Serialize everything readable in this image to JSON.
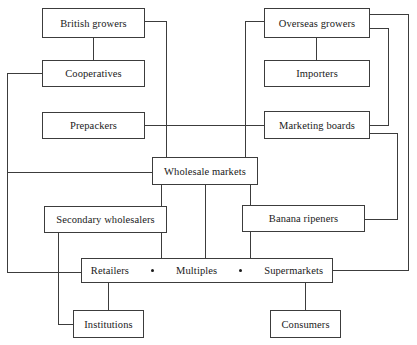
{
  "diagram": {
    "line_color": "#3c3c3c",
    "box_fill": "#ffffff",
    "nodes": [
      {
        "id": "british-growers",
        "label": "British growers",
        "x": 42,
        "y": 8,
        "w": 103,
        "h": 30
      },
      {
        "id": "overseas-growers",
        "label": "Overseas growers",
        "x": 264,
        "y": 8,
        "w": 106,
        "h": 30
      },
      {
        "id": "cooperatives",
        "label": "Cooperatives",
        "x": 42,
        "y": 60,
        "w": 103,
        "h": 27
      },
      {
        "id": "importers",
        "label": "Importers",
        "x": 264,
        "y": 60,
        "w": 106,
        "h": 27
      },
      {
        "id": "prepackers",
        "label": "Prepackers",
        "x": 42,
        "y": 112,
        "w": 103,
        "h": 27
      },
      {
        "id": "marketing-boards",
        "label": "Marketing boards",
        "x": 264,
        "y": 111,
        "w": 106,
        "h": 28
      },
      {
        "id": "wholesale-markets",
        "label": "Wholesale markets",
        "x": 152,
        "y": 157,
        "w": 106,
        "h": 28
      },
      {
        "id": "secondary-wholesalers",
        "label": "Secondary wholesalers",
        "x": 44,
        "y": 206,
        "w": 123,
        "h": 27
      },
      {
        "id": "banana-ripeners",
        "label": "Banana ripeners",
        "x": 242,
        "y": 205,
        "w": 123,
        "h": 27
      },
      {
        "id": "institutions",
        "label": "Institutions",
        "x": 73,
        "y": 310,
        "w": 71,
        "h": 28
      },
      {
        "id": "consumers",
        "label": "Consumers",
        "x": 270,
        "y": 310,
        "w": 71,
        "h": 28
      }
    ],
    "retail_row": {
      "id": "retailers-row",
      "x": 81,
      "y": 258,
      "w": 252,
      "h": 25,
      "labels": [
        "Retailers",
        "Multiples",
        "Supermarkets"
      ],
      "separator": "bullet"
    }
  }
}
